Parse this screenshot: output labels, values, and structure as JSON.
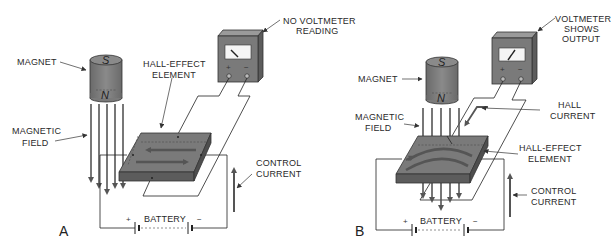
{
  "figure": {
    "colors": {
      "body": "#7a7a7a",
      "body_dark": "#5c5c5c",
      "body_light": "#9a9a9a",
      "line": "#2a2a2a",
      "arrow": "#555555",
      "background": "#ffffff"
    }
  },
  "panel_a": {
    "tag": "A",
    "voltmeter_label": [
      "NO VOLTMETER",
      "READING"
    ],
    "magnet_label": "MAGNET",
    "magnet_south": "S",
    "magnet_north": "N",
    "field_label": [
      "MAGNETIC",
      "FIELD"
    ],
    "element_label": [
      "HALL-EFFECT",
      "ELEMENT"
    ],
    "control_label": [
      "CONTROL",
      "CURRENT"
    ],
    "battery_label": "BATTERY",
    "battery_plus": "+",
    "battery_minus": "−",
    "meter_plus": "+",
    "meter_minus": "−"
  },
  "panel_b": {
    "tag": "B",
    "voltmeter_label": [
      "VOLTMETER",
      "SHOWS",
      "OUTPUT"
    ],
    "magnet_label": "MAGNET",
    "magnet_south": "S",
    "magnet_north": "N",
    "field_label": [
      "MAGNETIC",
      "FIELD"
    ],
    "hall_current_label": [
      "HALL",
      "CURRENT"
    ],
    "element_label": [
      "HALL-EFFECT",
      "ELEMENT"
    ],
    "control_label": [
      "CONTROL",
      "CURRENT"
    ],
    "battery_label": "BATTERY",
    "battery_plus": "+",
    "battery_minus": "−",
    "meter_plus": "+",
    "meter_minus": "−"
  }
}
